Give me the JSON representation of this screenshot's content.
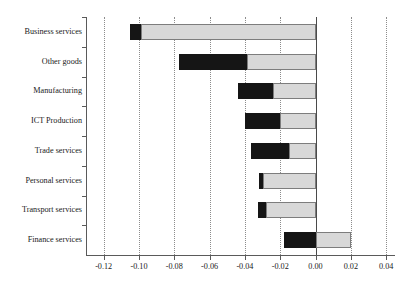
{
  "chart_data": {
    "type": "bar",
    "orientation": "horizontal",
    "title": "",
    "xlabel": "",
    "ylabel": "",
    "xlim": [
      -0.13,
      0.045
    ],
    "grid": true,
    "legend": "none",
    "categories": [
      "Business services",
      "Other goods",
      "Manufacturing",
      "ICT Production",
      "Trade services",
      "Personal services",
      "Transport services",
      "Finance  services"
    ],
    "xticks": [
      -0.12,
      -0.1,
      -0.08,
      -0.06,
      -0.04,
      -0.02,
      0.0,
      0.02,
      0.04
    ],
    "xtick_labels": [
      "-0.12",
      "-0.10",
      "-0.08",
      "-0.06",
      "-0.04",
      "-0.02",
      "0.00",
      "0.02",
      "0.04"
    ],
    "series": [
      {
        "name": "dark-segment",
        "color": "#151515",
        "segments": [
          {
            "category": "Business services",
            "start": -0.105,
            "end": -0.099
          },
          {
            "category": "Other goods",
            "start": -0.0775,
            "end": -0.039
          },
          {
            "category": "Manufacturing",
            "start": -0.044,
            "end": -0.024
          },
          {
            "category": "ICT Production",
            "start": -0.04,
            "end": -0.02
          },
          {
            "category": "Trade services",
            "start": -0.0365,
            "end": -0.015
          },
          {
            "category": "Personal services",
            "start": -0.032,
            "end": -0.03
          },
          {
            "category": "Transport services",
            "start": -0.0325,
            "end": -0.028
          },
          {
            "category": "Finance  services",
            "start": -0.018,
            "end": 0.0
          }
        ]
      },
      {
        "name": "light-segment",
        "color": "#d8d8d8",
        "segments": [
          {
            "category": "Business services",
            "start": -0.099,
            "end": 0.0
          },
          {
            "category": "Other goods",
            "start": -0.039,
            "end": 0.0
          },
          {
            "category": "Manufacturing",
            "start": -0.024,
            "end": 0.0
          },
          {
            "category": "ICT Production",
            "start": -0.02,
            "end": 0.0
          },
          {
            "category": "Trade services",
            "start": -0.015,
            "end": 0.0
          },
          {
            "category": "Personal services",
            "start": -0.03,
            "end": 0.0
          },
          {
            "category": "Transport services",
            "start": -0.028,
            "end": 0.0
          },
          {
            "category": "Finance  services",
            "start": 0.0,
            "end": 0.02
          }
        ]
      }
    ],
    "totals": {
      "Business services": -0.105,
      "Other goods": -0.0775,
      "Manufacturing": -0.044,
      "ICT Production": -0.04,
      "Trade services": -0.0365,
      "Personal services": -0.032,
      "Transport services": -0.0325,
      "Finance  services": 0.02
    }
  }
}
